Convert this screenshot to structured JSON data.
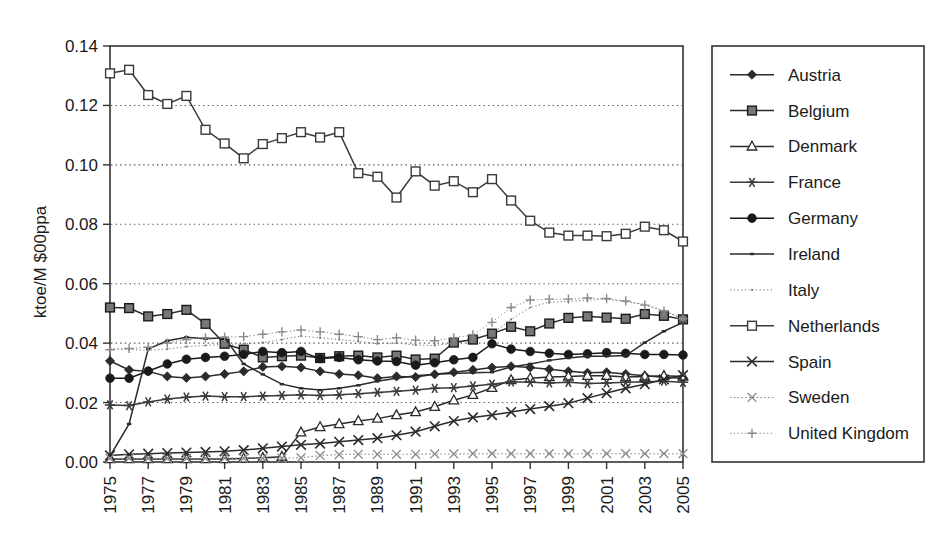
{
  "chart_data": {
    "type": "line",
    "title": "",
    "xlabel": "",
    "ylabel": "ktoe/M $00ppa",
    "ylim": [
      0.0,
      0.14
    ],
    "ytick_labels": [
      "0.00",
      "0.02",
      "0.04",
      "0.06",
      "0.08",
      "0.10",
      "0.12",
      "0.14"
    ],
    "ytick_values": [
      0.0,
      0.02,
      0.04,
      0.06,
      0.08,
      0.1,
      0.12,
      0.14
    ],
    "grid": "horizontal-dotted",
    "legend_position": "right-outside",
    "x": [
      1975,
      1976,
      1977,
      1978,
      1979,
      1980,
      1981,
      1982,
      1983,
      1984,
      1985,
      1986,
      1987,
      1988,
      1989,
      1990,
      1991,
      1992,
      1993,
      1994,
      1995,
      1996,
      1997,
      1998,
      1999,
      2000,
      2001,
      2002,
      2003,
      2004,
      2005
    ],
    "xtick_labels": [
      "1975",
      "1977",
      "1979",
      "1981",
      "1983",
      "1985",
      "1987",
      "1989",
      "1991",
      "1993",
      "1995",
      "1997",
      "1999",
      "2001",
      "2003",
      "2005"
    ],
    "xtick_values": [
      1975,
      1977,
      1979,
      1981,
      1983,
      1985,
      1987,
      1989,
      1991,
      1993,
      1995,
      1997,
      1999,
      2001,
      2003,
      2005
    ],
    "series": [
      {
        "name": "Austria",
        "marker": "diamond-filled",
        "color": "#2b2b2b",
        "values": [
          0.034,
          0.031,
          0.0305,
          0.0288,
          0.0283,
          0.0288,
          0.0296,
          0.0305,
          0.032,
          0.0322,
          0.0318,
          0.0305,
          0.0296,
          0.0292,
          0.0282,
          0.0288,
          0.0286,
          0.0295,
          0.0302,
          0.031,
          0.0318,
          0.0322,
          0.0318,
          0.0312,
          0.0305,
          0.03,
          0.0302,
          0.0296,
          0.029,
          0.0285,
          0.0282
        ]
      },
      {
        "name": "Belgium",
        "marker": "square-filled",
        "color": "#2b2b2b",
        "values": [
          0.052,
          0.0518,
          0.049,
          0.0498,
          0.0512,
          0.0465,
          0.0398,
          0.0378,
          0.0352,
          0.0356,
          0.0358,
          0.035,
          0.0356,
          0.0358,
          0.0352,
          0.0358,
          0.0345,
          0.0348,
          0.0402,
          0.0412,
          0.0432,
          0.0455,
          0.044,
          0.0466,
          0.0485,
          0.049,
          0.0486,
          0.0482,
          0.0498,
          0.0492,
          0.048
        ]
      },
      {
        "name": "Denmark",
        "marker": "triangle-open",
        "color": "#2b2b2b",
        "values": [
          0.001,
          0.001,
          0.001,
          0.001,
          0.001,
          0.001,
          0.001,
          0.0012,
          0.0014,
          0.0018,
          0.01,
          0.0118,
          0.0128,
          0.0138,
          0.0146,
          0.0158,
          0.0168,
          0.0186,
          0.0208,
          0.0226,
          0.025,
          0.0276,
          0.0282,
          0.0286,
          0.0288,
          0.029,
          0.029,
          0.0286,
          0.0288,
          0.029,
          0.0288
        ]
      },
      {
        "name": "France",
        "marker": "asterisk",
        "color": "#3a3a3a",
        "values": [
          0.0192,
          0.019,
          0.0202,
          0.0212,
          0.0218,
          0.0222,
          0.022,
          0.022,
          0.0222,
          0.0224,
          0.0226,
          0.0224,
          0.0226,
          0.023,
          0.0234,
          0.0238,
          0.0242,
          0.0248,
          0.025,
          0.0256,
          0.0262,
          0.027,
          0.0268,
          0.0266,
          0.0268,
          0.0264,
          0.0266,
          0.0268,
          0.027,
          0.0272,
          0.0268
        ]
      },
      {
        "name": "Germany",
        "marker": "circle-filled",
        "color": "#1a1a1a",
        "values": [
          0.0282,
          0.0282,
          0.0306,
          0.033,
          0.0346,
          0.0352,
          0.0356,
          0.0362,
          0.0372,
          0.0368,
          0.0372,
          0.0348,
          0.0352,
          0.0344,
          0.034,
          0.0338,
          0.0326,
          0.0334,
          0.0344,
          0.0352,
          0.0398,
          0.038,
          0.0372,
          0.0366,
          0.0362,
          0.0364,
          0.0368,
          0.0366,
          0.0362,
          0.0362,
          0.036
        ]
      },
      {
        "name": "Ireland",
        "marker": "none-small",
        "color": "#2b2b2b",
        "values": [
          0.002,
          0.0128,
          0.038,
          0.0408,
          0.042,
          0.0415,
          0.0418,
          0.033,
          0.0295,
          0.0262,
          0.0248,
          0.0242,
          0.0248,
          0.0258,
          0.0272,
          0.0282,
          0.029,
          0.0295,
          0.0298,
          0.03,
          0.0302,
          0.032,
          0.033,
          0.0342,
          0.035,
          0.0356,
          0.0356,
          0.0358,
          0.0402,
          0.044,
          0.047
        ]
      },
      {
        "name": "Italy",
        "marker": "dotted-fine",
        "color": "#7a7a7a",
        "values": [
          0.0382,
          0.0378,
          0.0376,
          0.038,
          0.0388,
          0.0392,
          0.0396,
          0.0398,
          0.0402,
          0.0412,
          0.0424,
          0.0418,
          0.0412,
          0.0406,
          0.0398,
          0.04,
          0.0394,
          0.0392,
          0.04,
          0.0408,
          0.0432,
          0.048,
          0.052,
          0.0538,
          0.054,
          0.0545,
          0.0548,
          0.054,
          0.053,
          0.051,
          0.0482
        ]
      },
      {
        "name": "Netherlands",
        "marker": "square-open",
        "color": "#3a3a3a",
        "values": [
          0.1308,
          0.132,
          0.1235,
          0.1205,
          0.1232,
          0.1118,
          0.1072,
          0.1022,
          0.107,
          0.109,
          0.111,
          0.1092,
          0.111,
          0.0972,
          0.096,
          0.089,
          0.0978,
          0.093,
          0.0945,
          0.0908,
          0.0952,
          0.088,
          0.0812,
          0.0772,
          0.0762,
          0.0762,
          0.076,
          0.0768,
          0.0792,
          0.078,
          0.0742
        ]
      },
      {
        "name": "Spain",
        "marker": "cross-x",
        "color": "#2b2b2b",
        "values": [
          0.0022,
          0.0026,
          0.0028,
          0.003,
          0.0032,
          0.0034,
          0.0036,
          0.004,
          0.0046,
          0.0052,
          0.0058,
          0.0062,
          0.0068,
          0.0074,
          0.008,
          0.009,
          0.0102,
          0.012,
          0.0138,
          0.015,
          0.0158,
          0.0168,
          0.0178,
          0.0188,
          0.0198,
          0.0215,
          0.0232,
          0.0248,
          0.0262,
          0.0278,
          0.0292
        ]
      },
      {
        "name": "Sweden",
        "marker": "cross-x-light",
        "color": "#8a8a8a",
        "values": [
          0.0012,
          0.0012,
          0.0012,
          0.0012,
          0.0012,
          0.0012,
          0.0013,
          0.0013,
          0.0013,
          0.0013,
          0.0014,
          0.0022,
          0.0025,
          0.0026,
          0.0026,
          0.0026,
          0.0026,
          0.0027,
          0.0027,
          0.0028,
          0.0028,
          0.0028,
          0.0028,
          0.0028,
          0.0028,
          0.0028,
          0.0028,
          0.0028,
          0.0028,
          0.0028,
          0.0028
        ]
      },
      {
        "name": "United Kingdom",
        "marker": "plus-dotted",
        "color": "#8a8a8a",
        "values": [
          0.0378,
          0.0382,
          0.0386,
          0.04,
          0.0412,
          0.0418,
          0.042,
          0.0422,
          0.043,
          0.0438,
          0.0444,
          0.0438,
          0.043,
          0.0422,
          0.0412,
          0.0418,
          0.041,
          0.0408,
          0.0418,
          0.0428,
          0.047,
          0.052,
          0.0545,
          0.0548,
          0.0548,
          0.0552,
          0.055,
          0.0542,
          0.0528,
          0.0508,
          0.0482
        ]
      }
    ]
  },
  "legend": {
    "items": [
      {
        "label": "Austria"
      },
      {
        "label": "Belgium"
      },
      {
        "label": "Denmark"
      },
      {
        "label": "France"
      },
      {
        "label": "Germany"
      },
      {
        "label": "Ireland"
      },
      {
        "label": "Italy"
      },
      {
        "label": "Netherlands"
      },
      {
        "label": "Spain"
      },
      {
        "label": "Sweden"
      },
      {
        "label": "United Kingdom"
      }
    ]
  },
  "colors": {
    "background": "#ffffff",
    "frame": "#333333",
    "grid": "#555555",
    "text": "#1a1a1a"
  }
}
